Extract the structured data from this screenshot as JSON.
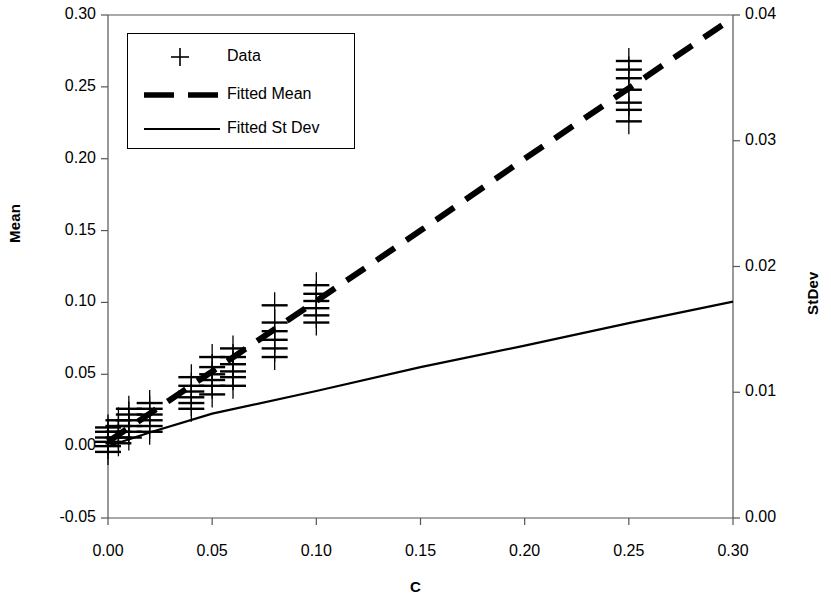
{
  "chart_data": {
    "type": "scatter",
    "title": "",
    "xlabel": "C",
    "ylabel": "Mean",
    "y2label": "StDev",
    "xlim": [
      0.0,
      0.3
    ],
    "ylim": [
      -0.05,
      0.3
    ],
    "y2lim": [
      0.0,
      0.04
    ],
    "grid": false,
    "legend_position": "top-left",
    "xticks": [
      "0.00",
      "0.05",
      "0.10",
      "0.15",
      "0.20",
      "0.25",
      "0.30"
    ],
    "xtick_values": [
      0.0,
      0.05,
      0.1,
      0.15,
      0.2,
      0.25,
      0.3
    ],
    "yticks": [
      "-0.05",
      "0.00",
      "0.05",
      "0.10",
      "0.15",
      "0.20",
      "0.25",
      "0.30"
    ],
    "ytick_values": [
      -0.05,
      0.0,
      0.05,
      0.1,
      0.15,
      0.2,
      0.25,
      0.3
    ],
    "y2ticks": [
      "0.00",
      "0.01",
      "0.02",
      "0.03",
      "0.04"
    ],
    "y2tick_values": [
      0.0,
      0.01,
      0.02,
      0.03,
      0.04
    ],
    "legend": [
      {
        "label": "Data",
        "marker": "plus",
        "style": "marker"
      },
      {
        "label": "Fitted Mean",
        "marker": "line",
        "style": "dashed"
      },
      {
        "label": "Fitted St Dev",
        "marker": "line",
        "style": "solid"
      }
    ],
    "series": [
      {
        "name": "Data",
        "axis": "left",
        "marker": "+",
        "points": [
          {
            "x": 0.0,
            "y": -0.004
          },
          {
            "x": 0.0,
            "y": 0.0
          },
          {
            "x": 0.0,
            "y": 0.003
          },
          {
            "x": 0.0,
            "y": 0.006
          },
          {
            "x": 0.0,
            "y": 0.01
          },
          {
            "x": 0.0,
            "y": 0.013
          },
          {
            "x": 0.005,
            "y": 0.002
          },
          {
            "x": 0.005,
            "y": 0.006
          },
          {
            "x": 0.005,
            "y": 0.01
          },
          {
            "x": 0.005,
            "y": 0.014
          },
          {
            "x": 0.005,
            "y": 0.018
          },
          {
            "x": 0.01,
            "y": 0.006
          },
          {
            "x": 0.01,
            "y": 0.01
          },
          {
            "x": 0.01,
            "y": 0.014
          },
          {
            "x": 0.01,
            "y": 0.018
          },
          {
            "x": 0.01,
            "y": 0.022
          },
          {
            "x": 0.01,
            "y": 0.026
          },
          {
            "x": 0.02,
            "y": 0.01
          },
          {
            "x": 0.02,
            "y": 0.014
          },
          {
            "x": 0.02,
            "y": 0.018
          },
          {
            "x": 0.02,
            "y": 0.022
          },
          {
            "x": 0.02,
            "y": 0.026
          },
          {
            "x": 0.02,
            "y": 0.03
          },
          {
            "x": 0.04,
            "y": 0.026
          },
          {
            "x": 0.04,
            "y": 0.03
          },
          {
            "x": 0.04,
            "y": 0.034
          },
          {
            "x": 0.04,
            "y": 0.038
          },
          {
            "x": 0.04,
            "y": 0.042
          },
          {
            "x": 0.04,
            "y": 0.048
          },
          {
            "x": 0.05,
            "y": 0.036
          },
          {
            "x": 0.05,
            "y": 0.042
          },
          {
            "x": 0.05,
            "y": 0.046
          },
          {
            "x": 0.05,
            "y": 0.05
          },
          {
            "x": 0.05,
            "y": 0.055
          },
          {
            "x": 0.05,
            "y": 0.062
          },
          {
            "x": 0.06,
            "y": 0.042
          },
          {
            "x": 0.06,
            "y": 0.048
          },
          {
            "x": 0.06,
            "y": 0.052
          },
          {
            "x": 0.06,
            "y": 0.057
          },
          {
            "x": 0.06,
            "y": 0.062
          },
          {
            "x": 0.06,
            "y": 0.068
          },
          {
            "x": 0.08,
            "y": 0.062
          },
          {
            "x": 0.08,
            "y": 0.068
          },
          {
            "x": 0.08,
            "y": 0.074
          },
          {
            "x": 0.08,
            "y": 0.08
          },
          {
            "x": 0.08,
            "y": 0.086
          },
          {
            "x": 0.08,
            "y": 0.098
          },
          {
            "x": 0.1,
            "y": 0.086
          },
          {
            "x": 0.1,
            "y": 0.091
          },
          {
            "x": 0.1,
            "y": 0.096
          },
          {
            "x": 0.1,
            "y": 0.101
          },
          {
            "x": 0.1,
            "y": 0.106
          },
          {
            "x": 0.1,
            "y": 0.112
          },
          {
            "x": 0.25,
            "y": 0.226
          },
          {
            "x": 0.25,
            "y": 0.234
          },
          {
            "x": 0.25,
            "y": 0.239
          },
          {
            "x": 0.25,
            "y": 0.248
          },
          {
            "x": 0.25,
            "y": 0.256
          },
          {
            "x": 0.25,
            "y": 0.262
          },
          {
            "x": 0.25,
            "y": 0.268
          }
        ]
      },
      {
        "name": "Fitted Mean",
        "axis": "left",
        "style": "dashed",
        "x": [
          0.0,
          0.05,
          0.1,
          0.15,
          0.2,
          0.25,
          0.3
        ],
        "values": [
          0.003,
          0.052,
          0.101,
          0.15,
          0.2,
          0.249,
          0.298
        ]
      },
      {
        "name": "Fitted St Dev",
        "axis": "right",
        "style": "solid",
        "x": [
          0.0,
          0.02,
          0.05,
          0.1,
          0.15,
          0.2,
          0.25,
          0.3
        ],
        "values": [
          0.0057,
          0.0068,
          0.0083,
          0.0101,
          0.012,
          0.0137,
          0.0155,
          0.0172
        ]
      }
    ]
  },
  "axes": {
    "left_title": "Mean",
    "right_title": "StDev",
    "x_title": "C"
  }
}
